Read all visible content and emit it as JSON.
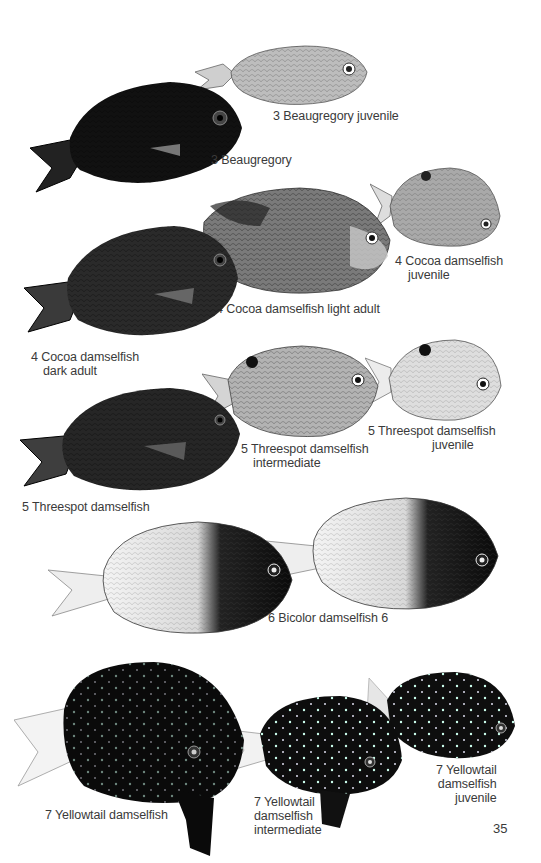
{
  "page": {
    "page_number": "35",
    "background": "#ffffff",
    "ink_dark": "#111111",
    "ink_mid": "#6a6a6a",
    "ink_light": "#d8d8d8"
  },
  "plates": [
    {
      "id": "beaugregory-juvenile",
      "caption": [
        "3 Beaugregory juvenile"
      ]
    },
    {
      "id": "beaugregory",
      "caption": [
        "3 Beaugregory"
      ]
    },
    {
      "id": "cocoa-juvenile",
      "caption": [
        "4 Cocoa damselfish",
        "juvenile"
      ]
    },
    {
      "id": "cocoa-light-adult",
      "caption": [
        "4 Cocoa damselfish light adult"
      ]
    },
    {
      "id": "cocoa-dark-adult",
      "caption": [
        "4 Cocoa damselfish",
        "dark adult"
      ]
    },
    {
      "id": "threespot-intermediate",
      "caption": [
        "5 Threespot damselfish",
        "intermediate"
      ]
    },
    {
      "id": "threespot-juvenile",
      "caption": [
        "5 Threespot damselfish",
        "juvenile"
      ]
    },
    {
      "id": "threespot",
      "caption": [
        "5 Threespot damselfish"
      ]
    },
    {
      "id": "bicolor",
      "caption": [
        "6 Bicolor damselfish 6"
      ]
    },
    {
      "id": "yellowtail",
      "caption": [
        "7 Yellowtail damselfish"
      ]
    },
    {
      "id": "yellowtail-intermediate",
      "caption": [
        "7 Yellowtail",
        "damselfish",
        "intermediate"
      ]
    },
    {
      "id": "yellowtail-juvenile",
      "caption": [
        "7 Yellowtail",
        "damselfish",
        "juvenile"
      ]
    }
  ]
}
